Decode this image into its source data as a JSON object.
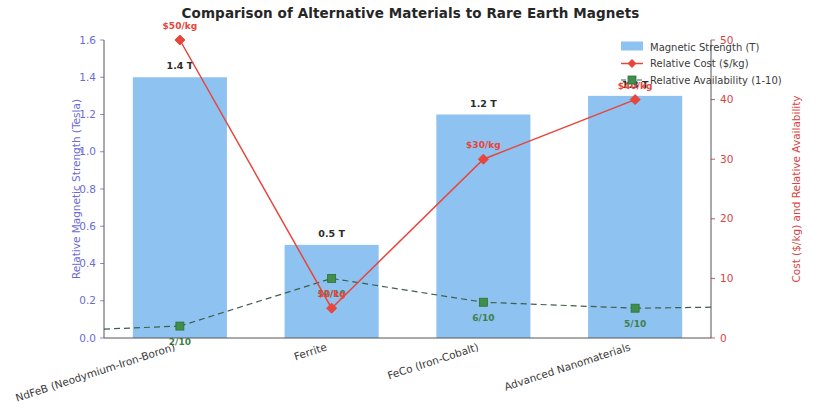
{
  "chart_data": {
    "type": "bar",
    "title": "Comparison of Alternative Materials to Rare Earth Magnets",
    "categories": [
      "NdFeB (Neodymium-Iron-Boron)",
      "Ferrite",
      "FeCo (Iron-Cobalt)",
      "Advanced Nanomaterials"
    ],
    "series": [
      {
        "name": "Magnetic Strength (T)",
        "kind": "bar",
        "axis": "left",
        "color": "#8ec2f0",
        "values": [
          1.4,
          0.5,
          1.2,
          1.3
        ],
        "point_labels": [
          "1.4 T",
          "0.5 T",
          "1.2 T",
          "1.3 T"
        ]
      },
      {
        "name": "Relative Cost ($/kg)",
        "kind": "line",
        "axis": "right",
        "color": "#e8453c",
        "values": [
          50,
          5,
          30,
          40
        ],
        "point_labels": [
          "$50/kg",
          "$2/kg",
          "$30/kg",
          "$40/kg"
        ]
      },
      {
        "name": "Relative Availability (1-10)",
        "kind": "line-dashed",
        "axis": "right",
        "color": "#3f8f4a",
        "values": [
          2,
          10,
          6,
          5
        ],
        "point_labels": [
          "2/10",
          "10/10",
          "6/10",
          "5/10"
        ]
      }
    ],
    "ylabel": "Relative Magnetic Strength (Tesla)",
    "ylabel_right": "Cost ($/kg) and Relative Availability",
    "xlabel": "",
    "ylim": [
      0.0,
      1.6
    ],
    "ylim_right": [
      0,
      50
    ],
    "yticks": [
      "0.0",
      "0.2",
      "0.4",
      "0.6",
      "0.8",
      "1.0",
      "1.2",
      "1.4",
      "1.6"
    ],
    "ytick_values": [
      0.0,
      0.2,
      0.4,
      0.6,
      0.8,
      1.0,
      1.2,
      1.4,
      1.6
    ],
    "yticks_right": [
      "0",
      "10",
      "20",
      "30",
      "40",
      "50"
    ],
    "ytick_values_right": [
      0,
      10,
      20,
      30,
      40,
      50
    ],
    "grid": false,
    "legend_position": "upper right"
  },
  "legend": {
    "items": [
      {
        "label": "Magnetic Strength (T)",
        "marker": "patch",
        "color": "#8ec2f0"
      },
      {
        "label": "Relative Cost ($/kg)",
        "marker": "line-solid-diamond",
        "color": "#e8453c"
      },
      {
        "label": "Relative Availability (1-10)",
        "marker": "line-dashed-square",
        "color": "#3f8f4a"
      }
    ]
  }
}
